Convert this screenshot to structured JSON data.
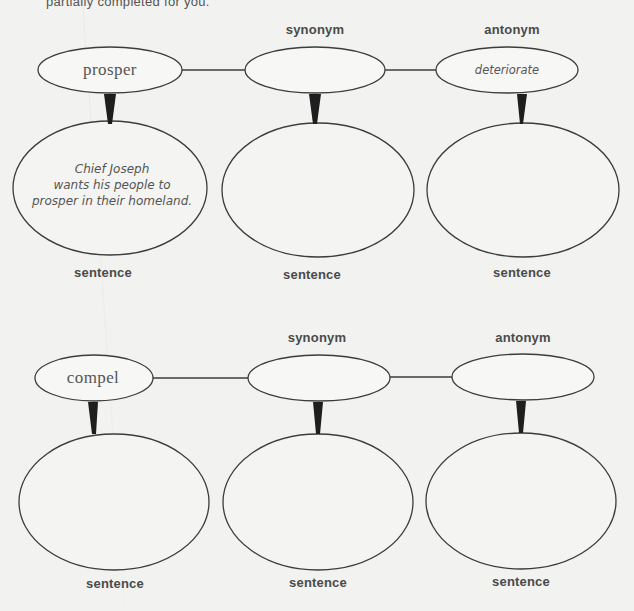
{
  "instructions_fragment": "partially completed for you.",
  "maps": [
    {
      "headers": {
        "synonym": "synonym",
        "antonym": "antonym"
      },
      "word": "prosper",
      "synonym": "",
      "antonym": "deteriorate",
      "sentences": [
        {
          "text_lines": [
            "Chief Joseph",
            "wants his people to",
            "prosper in their homeland."
          ],
          "label": "sentence"
        },
        {
          "text_lines": [],
          "label": "sentence"
        },
        {
          "text_lines": [],
          "label": "sentence"
        }
      ]
    },
    {
      "headers": {
        "synonym": "synonym",
        "antonym": "antonym"
      },
      "word": "compel",
      "synonym": "",
      "antonym": "",
      "sentences": [
        {
          "text_lines": [],
          "label": "sentence"
        },
        {
          "text_lines": [],
          "label": "sentence"
        },
        {
          "text_lines": [],
          "label": "sentence"
        }
      ]
    }
  ],
  "colors": {
    "background": "#f2f2f0",
    "stroke": "#3c3c3c",
    "text": "#4a4a4a"
  }
}
